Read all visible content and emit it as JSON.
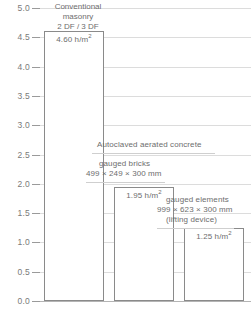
{
  "chart_data": {
    "type": "bar",
    "title": "",
    "xlabel": "",
    "ylabel": "",
    "ylim": [
      0.0,
      5.0
    ],
    "grid": true,
    "legend_position": "none",
    "unit": "h/m²",
    "categories": [
      "Conventional masonry 2 DF / 3 DF",
      "Autoclaved aerated concrete – gauged bricks 499 × 249 × 300 mm",
      "Autoclaved aerated concrete – gauged elements 999 × 623 × 300 mm (lifting device)"
    ],
    "values": [
      4.6,
      1.95,
      1.25
    ],
    "ytick_labels": [
      "0.0",
      "0.5",
      "1.0",
      "1.5",
      "2.0",
      "2.5",
      "3.0",
      "3.5",
      "4.0",
      "4.5",
      "5.0"
    ],
    "ytick_values": [
      0.0,
      0.5,
      1.0,
      1.5,
      2.0,
      2.5,
      3.0,
      3.5,
      4.0,
      4.5,
      5.0
    ]
  },
  "bars": [
    {
      "value_label": "4.60 h/m",
      "value_sup": "2",
      "value": 4.6
    },
    {
      "value_label": "1.95 h/m",
      "value_sup": "2",
      "value": 1.95
    },
    {
      "value_label": "1.25 h/m",
      "value_sup": "2",
      "value": 1.25
    }
  ],
  "annotations": {
    "conventional_line1": "Conventional",
    "conventional_line2": "masonry",
    "conventional_line3": "2 DF / 3 DF",
    "aac_heading": "Autoclaved aerated concrete",
    "bricks_line1": "gauged bricks",
    "bricks_line2": "499 × 249 × 300 mm",
    "elements_line1": "gauged elements",
    "elements_line2": "999 × 623 × 300 mm",
    "elements_line3": "(lifting device)"
  },
  "colors": {
    "background": "#ffffff",
    "text": "#6d6d6d",
    "gridline": "#dcdcdc",
    "bar_outline": "#8a8a8a",
    "axis": "#b4b4b4"
  }
}
